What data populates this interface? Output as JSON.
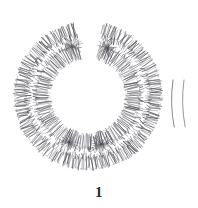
{
  "figure": {
    "caption": "1",
    "medium": "line-art hatched drawing",
    "background_color": "#ffffff",
    "ink_color": "#55555c",
    "caption_color": "#2b2b2b"
  },
  "geometry": {
    "canvas": {
      "width": 198,
      "height": 208
    },
    "center": {
      "x": 88,
      "y": 96
    },
    "outer_band": {
      "inner_radius": 62,
      "outer_radius": 73,
      "tick_count": 300
    },
    "inner_band": {
      "inner_radius": 39,
      "outer_radius": 52,
      "tick_count": 230
    },
    "hole_radius": 38,
    "top_gap_degrees": [
      78,
      100
    ],
    "fragment": {
      "label": "detached-arc-fragment",
      "x_range": [
        173,
        184
      ],
      "y_range": [
        80,
        127
      ],
      "arc_count": 2
    },
    "burst_nodes": [
      {
        "name": "burst-top-left",
        "angle_degrees": 108,
        "radius": 52
      },
      {
        "name": "burst-top-right",
        "angle_degrees": 68,
        "radius": 52
      },
      {
        "name": "burst-bottom-left",
        "angle_degrees": 248,
        "radius": 50
      },
      {
        "name": "burst-bottom-right",
        "angle_degrees": 285,
        "radius": 50
      }
    ]
  },
  "elements": {
    "outer_ring_name": "outer-hatched-ring",
    "inner_ring_name": "inner-hatched-ring",
    "fragment_name": "detached-arc-fragment",
    "caption_name": "figure-number-label"
  }
}
